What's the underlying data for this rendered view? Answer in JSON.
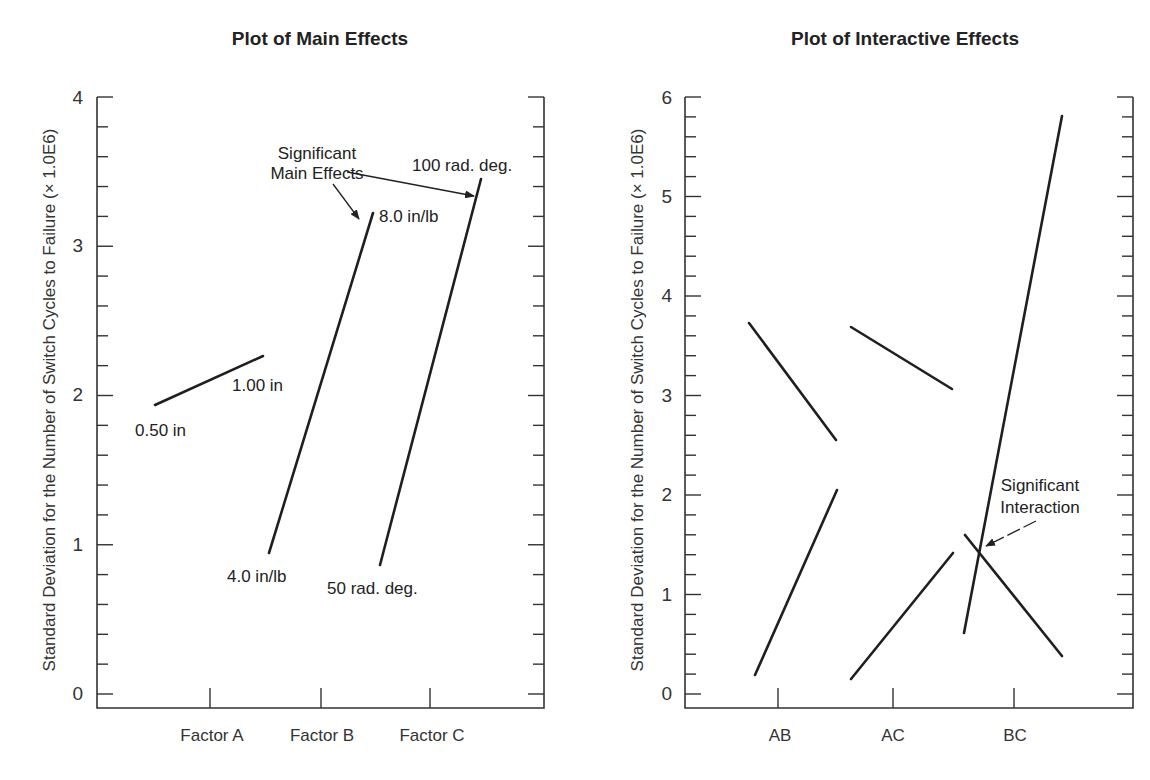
{
  "chart_data": [
    {
      "type": "line",
      "title": "Plot of Main Effects",
      "xlabel": "",
      "ylabel": "Standard Deviation for the Number of Switch Cycles to Failure (× 1.0E6)",
      "ylim": [
        0,
        4
      ],
      "yticks": [
        "0",
        "1",
        "2",
        "3",
        "4"
      ],
      "minor_tick_step": 0.2,
      "categories": [
        "Factor A",
        "Factor B",
        "Factor C"
      ],
      "grid": false,
      "series": [
        {
          "name": "Factor A",
          "points": [
            {
              "label": "0.50 in",
              "y": 1.93
            },
            {
              "label": "1.00 in",
              "y": 2.26
            }
          ]
        },
        {
          "name": "Factor B",
          "points": [
            {
              "label": "4.0 in/lb",
              "y": 0.94
            },
            {
              "label": "8.0 in/lb",
              "y": 3.22
            }
          ]
        },
        {
          "name": "Factor C",
          "points": [
            {
              "label": "50 rad. deg.",
              "y": 0.86
            },
            {
              "label": "100 rad. deg.",
              "y": 3.44
            }
          ]
        }
      ],
      "annotations": [
        {
          "text": "Significant Main Effects",
          "points_to": [
            "Factor B",
            "Factor C"
          ]
        }
      ]
    },
    {
      "type": "line",
      "title": "Plot of Interactive Effects",
      "xlabel": "",
      "ylabel": "Standard Deviation for the Number of Switch Cycles to Failure (× 1.0E6)",
      "ylim": [
        0,
        6
      ],
      "yticks": [
        "0",
        "1",
        "2",
        "3",
        "4",
        "5",
        "6"
      ],
      "minor_tick_step": 0.2,
      "categories": [
        "AB",
        "AC",
        "BC"
      ],
      "grid": false,
      "series": [
        {
          "name": "AB line 1",
          "values": [
            3.73,
            2.55
          ]
        },
        {
          "name": "AB line 2",
          "values": [
            0.19,
            2.05
          ]
        },
        {
          "name": "AC line 1",
          "values": [
            3.69,
            3.07
          ]
        },
        {
          "name": "AC line 2",
          "values": [
            0.15,
            1.42
          ]
        },
        {
          "name": "BC line 1",
          "values": [
            0.61,
            5.81
          ]
        },
        {
          "name": "BC line 2",
          "values": [
            1.6,
            0.38
          ]
        }
      ],
      "annotations": [
        {
          "text": "Significant Interaction",
          "points_to": "BC crossing"
        }
      ]
    }
  ],
  "left": {
    "title": "Plot of Main Effects",
    "ylabel": "Standard Deviation for the Number of Switch Cycles to Failure (× 1.0E6)",
    "yticks": [
      "0",
      "1",
      "2",
      "3",
      "4"
    ],
    "categories": [
      "Factor A",
      "Factor B",
      "Factor C"
    ],
    "labels": {
      "a_low": "0.50 in",
      "a_high": "1.00 in",
      "b_low": "4.0 in/lb",
      "b_high": "8.0 in/lb",
      "c_low": "50 rad. deg.",
      "c_high": "100 rad. deg."
    },
    "annotation_line1": "Significant",
    "annotation_line2": "Main Effects"
  },
  "right": {
    "title": "Plot of Interactive Effects",
    "ylabel": "Standard Deviation for the Number of Switch Cycles to Failure (× 1.0E6)",
    "yticks": [
      "0",
      "1",
      "2",
      "3",
      "4",
      "5",
      "6"
    ],
    "categories": [
      "AB",
      "AC",
      "BC"
    ],
    "annotation_line1": "Significant",
    "annotation_line2": "Interaction"
  }
}
